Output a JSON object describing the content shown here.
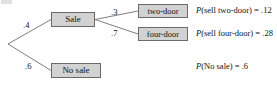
{
  "diagram": {
    "type": "probability-tree",
    "title": "",
    "root": {
      "label": "",
      "x": 8,
      "y": 44
    },
    "nodes": [
      {
        "id": "sale",
        "label": "Sale",
        "level": 1
      },
      {
        "id": "nosale",
        "label": "No sale",
        "level": 1
      },
      {
        "id": "twodoor",
        "label": "two-door",
        "level": 2
      },
      {
        "id": "fourdoor",
        "label": "four-door",
        "level": 2
      }
    ],
    "edges": [
      {
        "from": "root",
        "to": "sale",
        "probability": ".4"
      },
      {
        "from": "root",
        "to": "nosale",
        "probability": ".6"
      },
      {
        "from": "sale",
        "to": "twodoor",
        "probability": ".3"
      },
      {
        "from": "sale",
        "to": "fourdoor",
        "probability": ".7"
      }
    ],
    "statements": [
      {
        "id": "twodoor",
        "fn": "P",
        "argument": "(sell two-door)",
        "equals": "=",
        "value": ".12"
      },
      {
        "id": "fourdoor",
        "fn": "P",
        "argument": "(sell four-door)",
        "equals": "=",
        "value": ".28"
      },
      {
        "id": "nosale",
        "fn": "P",
        "argument": "(No sale)",
        "equals": "=",
        "value": ".6"
      }
    ],
    "colors": {
      "box_fill": "#d2d2d2",
      "box_border": "#6a6a6a",
      "line": "#6f6f6f",
      "text": "#111111",
      "background": "#ffffff"
    }
  }
}
